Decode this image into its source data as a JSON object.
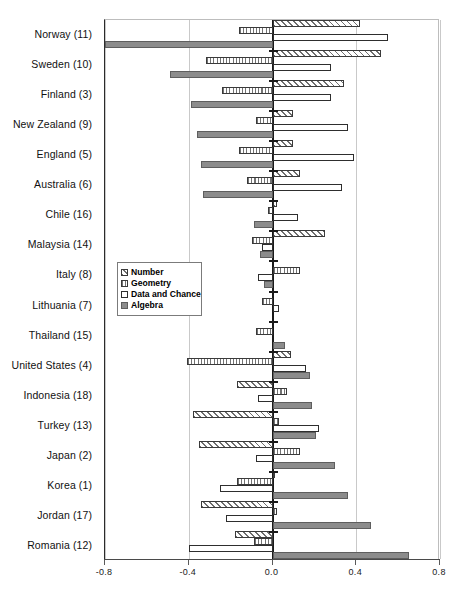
{
  "chart_data": {
    "type": "bar",
    "orientation": "horizontal",
    "title": "",
    "xlabel": "",
    "ylabel": "",
    "xlim": [
      -0.8,
      0.8
    ],
    "xticks": [
      "-0.8",
      "-0.4",
      "0.0",
      "0.4",
      "0.8"
    ],
    "xtick_values": [
      -0.8,
      -0.4,
      0.0,
      0.4,
      0.8
    ],
    "grid": "vertical-light",
    "zero_reference_line": true,
    "legend_position": "center-left-inside",
    "categories": [
      "Norway (11)",
      "Sweden (10)",
      "Finland (3)",
      "New Zealand (9)",
      "England (5)",
      "Australia (6)",
      "Chile (16)",
      "Malaysia (14)",
      "Italy (8)",
      "Lithuania (7)",
      "Thailand (15)",
      "United States (4)",
      "Indonesia (18)",
      "Turkey (13)",
      "Japan (2)",
      "Korea (1)",
      "Jordan (17)",
      "Romania (12)"
    ],
    "series": [
      {
        "name": "Number",
        "key": "number",
        "pattern": "diagonal-hatch",
        "values": [
          0.42,
          0.52,
          0.34,
          0.1,
          0.1,
          0.13,
          0.02,
          0.25,
          0.0,
          0.0,
          0.0,
          0.09,
          -0.17,
          -0.38,
          -0.35,
          0.01,
          -0.34,
          -0.18
        ]
      },
      {
        "name": "Geometry",
        "key": "geometry",
        "pattern": "vertical-hatch",
        "values": [
          -0.16,
          -0.32,
          -0.24,
          -0.08,
          -0.16,
          -0.12,
          -0.02,
          -0.1,
          0.13,
          -0.05,
          -0.08,
          -0.41,
          0.07,
          0.03,
          0.13,
          -0.17,
          0.02,
          -0.09
        ]
      },
      {
        "name": "Data and Chance",
        "key": "data_and_chance",
        "pattern": "solid-white-outline",
        "values": [
          0.55,
          0.28,
          0.28,
          0.36,
          0.39,
          0.33,
          0.12,
          -0.05,
          -0.07,
          0.03,
          0.0,
          0.16,
          -0.07,
          0.22,
          -0.08,
          -0.25,
          -0.22,
          -0.4
        ]
      },
      {
        "name": "Algebra",
        "key": "algebra",
        "pattern": "solid-gray",
        "values": [
          -0.8,
          -0.49,
          -0.39,
          -0.36,
          -0.34,
          -0.33,
          -0.09,
          -0.06,
          -0.04,
          0.0,
          0.06,
          0.18,
          0.19,
          0.21,
          0.3,
          0.36,
          0.47,
          0.65
        ]
      }
    ]
  },
  "legend": {
    "items": [
      {
        "label": "Number"
      },
      {
        "label": "Geometry"
      },
      {
        "label": "Data and Chance"
      },
      {
        "label": "Algebra"
      }
    ]
  },
  "caption": {
    "text": ""
  }
}
